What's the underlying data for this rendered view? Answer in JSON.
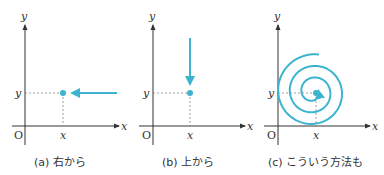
{
  "accent_color": "#3cb4cf",
  "panels": [
    {
      "id": "a",
      "caption": "(a) 右から",
      "axis_x_label": "x",
      "axis_y_label": "y",
      "origin_label": "O",
      "point_x_label": "x",
      "point_y_label": "y",
      "approach": "horizontal arrow from the right"
    },
    {
      "id": "b",
      "caption": "(b) 上から",
      "axis_x_label": "x",
      "axis_y_label": "y",
      "origin_label": "O",
      "point_x_label": "x",
      "point_y_label": "y",
      "approach": "vertical arrow from above"
    },
    {
      "id": "c",
      "caption": "(c) こういう方法も",
      "axis_x_label": "x",
      "axis_y_label": "y",
      "origin_label": "O",
      "point_x_label": "x",
      "point_y_label": "y",
      "approach": "spiral path"
    }
  ]
}
